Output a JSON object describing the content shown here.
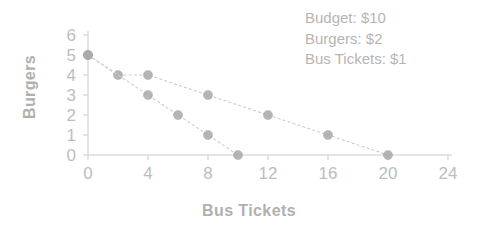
{
  "chart_data": {
    "type": "line",
    "title": "",
    "subtitle": "",
    "xlabel": "Bus Tickets",
    "ylabel": "Burgers",
    "xlim": [
      0,
      24
    ],
    "ylim": [
      0,
      6
    ],
    "xticks": [
      0,
      4,
      8,
      12,
      16,
      20,
      24
    ],
    "yticks": [
      0,
      1,
      2,
      3,
      4,
      5,
      6
    ],
    "grid": false,
    "legend": "none",
    "marker": "filled-circle",
    "line_style": "dashed",
    "series": [
      {
        "name": "budget-line-shallow",
        "x": [
          0,
          2,
          4,
          8,
          12,
          16,
          20
        ],
        "y": [
          5,
          4,
          4,
          3,
          2,
          1,
          0
        ]
      },
      {
        "name": "budget-line-steep",
        "x": [
          0,
          4,
          6,
          8,
          10
        ],
        "y": [
          5,
          3,
          2,
          1,
          0
        ]
      }
    ],
    "annotations": [
      "Budget: $10",
      "Burgers: $2",
      "Bus Tickets: $1"
    ],
    "colors": {
      "marker": "#a9a9a9",
      "line": "#cccccc",
      "axis": "#cbcbcb",
      "text": "#b5b5b5"
    }
  },
  "annotation_box": {
    "line1": "Budget: $10",
    "line2": "Burgers: $2",
    "line3": "Bus Tickets: $1"
  },
  "axes": {
    "x_title": "Bus Tickets",
    "y_title": "Burgers",
    "x_tick_labels": [
      "0",
      "4",
      "8",
      "12",
      "16",
      "20",
      "24"
    ],
    "y_tick_labels": [
      "0",
      "1",
      "2",
      "3",
      "4",
      "5",
      "6"
    ]
  }
}
